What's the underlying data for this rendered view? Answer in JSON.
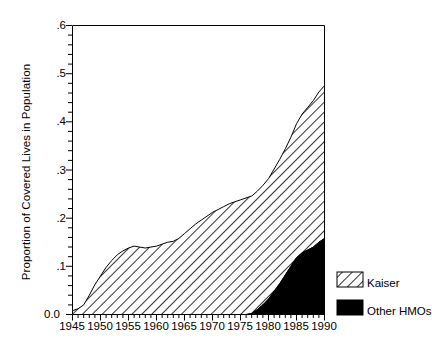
{
  "chart_data": {
    "type": "area",
    "title": "",
    "subtitle": "",
    "xlabel": "",
    "ylabel": "Proportion of Covered Lives in Population",
    "stacked": true,
    "grid": false,
    "legend_position": "right-bottom-inside",
    "xlim": [
      1945,
      1990
    ],
    "ylim": [
      0.0,
      0.6
    ],
    "xtick_labels": [
      "1945",
      "1950",
      "1955",
      "1960",
      "1965",
      "1970",
      "1975",
      "1980",
      "1985",
      "1990"
    ],
    "xticks": [
      1945,
      1950,
      1955,
      1960,
      1965,
      1970,
      1975,
      1980,
      1985,
      1990
    ],
    "ytick_labels": [
      "0.0",
      ".1",
      ".2",
      ".3",
      ".4",
      ".5",
      ".6"
    ],
    "yticks": [
      0.0,
      0.1,
      0.2,
      0.3,
      0.4,
      0.5,
      0.6
    ],
    "y_minor_tick_step": 0.02,
    "x": [
      1945,
      1946,
      1947,
      1948,
      1949,
      1950,
      1951,
      1952,
      1953,
      1954,
      1955,
      1956,
      1957,
      1958,
      1959,
      1960,
      1961,
      1962,
      1963,
      1964,
      1965,
      1966,
      1967,
      1968,
      1969,
      1970,
      1971,
      1972,
      1973,
      1974,
      1975,
      1976,
      1977,
      1978,
      1979,
      1980,
      1981,
      1982,
      1983,
      1984,
      1985,
      1986,
      1987,
      1988,
      1989,
      1990
    ],
    "series": [
      {
        "name": "Kaiser",
        "fill": "diagonal-hatch",
        "color": "#000000",
        "values": [
          0.008,
          0.012,
          0.02,
          0.04,
          0.062,
          0.08,
          0.098,
          0.112,
          0.124,
          0.132,
          0.138,
          0.142,
          0.14,
          0.138,
          0.14,
          0.142,
          0.146,
          0.15,
          0.152,
          0.158,
          0.168,
          0.178,
          0.188,
          0.196,
          0.204,
          0.212,
          0.218,
          0.224,
          0.23,
          0.234,
          0.238,
          0.242,
          0.244,
          0.246,
          0.248,
          0.25,
          0.254,
          0.258,
          0.262,
          0.268,
          0.278,
          0.288,
          0.296,
          0.304,
          0.312,
          0.317
        ]
      },
      {
        "name": "Other HMOs",
        "fill": "solid",
        "color": "#000000",
        "values": [
          0.0,
          0.0,
          0.0,
          0.0,
          0.0,
          0.0,
          0.0,
          0.0,
          0.0,
          0.0,
          0.0,
          0.0,
          0.0,
          0.0,
          0.0,
          0.0,
          0.0,
          0.0,
          0.0,
          0.0,
          0.0,
          0.0,
          0.0,
          0.0,
          0.0,
          0.0,
          0.0,
          0.0,
          0.0,
          0.0,
          0.0,
          0.0,
          0.002,
          0.01,
          0.02,
          0.032,
          0.048,
          0.064,
          0.082,
          0.1,
          0.118,
          0.128,
          0.134,
          0.14,
          0.15,
          0.158
        ]
      }
    ],
    "totals": [
      0.008,
      0.012,
      0.02,
      0.04,
      0.062,
      0.08,
      0.098,
      0.112,
      0.124,
      0.132,
      0.138,
      0.142,
      0.14,
      0.138,
      0.14,
      0.142,
      0.146,
      0.15,
      0.152,
      0.158,
      0.168,
      0.178,
      0.188,
      0.196,
      0.204,
      0.212,
      0.218,
      0.224,
      0.23,
      0.234,
      0.238,
      0.242,
      0.246,
      0.256,
      0.268,
      0.282,
      0.302,
      0.322,
      0.344,
      0.368,
      0.396,
      0.416,
      0.43,
      0.444,
      0.462,
      0.475
    ]
  },
  "legend": {
    "items": [
      {
        "label": "Kaiser",
        "swatch": "diagonal-hatch"
      },
      {
        "label": "Other HMOs",
        "swatch": "solid-black"
      }
    ]
  },
  "axes": {
    "y_title": "Proportion of Covered Lives in Population",
    "y_labels": [
      "0.0",
      ".1",
      ".2",
      ".3",
      ".4",
      ".5",
      ".6"
    ],
    "x_labels": [
      "1945",
      "1950",
      "1955",
      "1960",
      "1965",
      "1970",
      "1975",
      "1980",
      "1985",
      "1990"
    ]
  }
}
